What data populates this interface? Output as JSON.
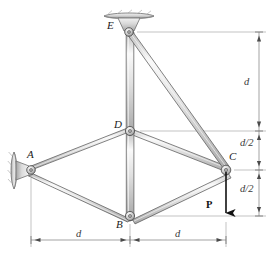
{
  "figure": {
    "type": "structural-truss-diagram"
  },
  "nodes": [
    {
      "id": "E",
      "label": "E",
      "x": 129,
      "y": 32,
      "label_dx": -11,
      "label_dy": -6,
      "support": "ceiling-bracket"
    },
    {
      "id": "D",
      "label": "D",
      "x": 130,
      "y": 131,
      "label_dx": -13,
      "label_dy": -6,
      "support": "none"
    },
    {
      "id": "A",
      "label": "A",
      "x": 31,
      "y": 170,
      "label_dx": -2,
      "label_dy": -17,
      "support": "wall-bracket"
    },
    {
      "id": "C",
      "label": "C",
      "x": 226,
      "y": 170,
      "label_dx": 4,
      "label_dy": -15,
      "support": "none"
    },
    {
      "id": "B",
      "label": "B",
      "x": 130,
      "y": 216,
      "label_dx": -12,
      "label_dy": 6,
      "support": "none"
    }
  ],
  "members": [
    {
      "id": "ED",
      "from": "E",
      "to": "D",
      "name": "member-E-D"
    },
    {
      "id": "EC",
      "from": "E",
      "to": "C",
      "name": "member-E-C"
    },
    {
      "id": "DA",
      "from": "D",
      "to": "A",
      "name": "member-D-A"
    },
    {
      "id": "DC",
      "from": "D",
      "to": "C",
      "name": "member-D-C"
    },
    {
      "id": "DB",
      "from": "D",
      "to": "B",
      "name": "member-D-B"
    },
    {
      "id": "AB",
      "from": "A",
      "to": "B",
      "name": "member-A-B"
    },
    {
      "id": "BC",
      "from": "B",
      "to": "C",
      "name": "member-B-C"
    }
  ],
  "load": {
    "label": "P",
    "label_x": 206,
    "label_y": 206,
    "direction": "down",
    "applied_at": "C",
    "arrow_from_y": 172,
    "arrow_to_y": 216,
    "arrow_x": 226
  },
  "dimensions": {
    "vertical": [
      {
        "id": "d-top",
        "label": "d",
        "label_x": 254,
        "label_y": 85,
        "from_y": 32,
        "to_y": 131
      },
      {
        "id": "d-half-up",
        "label": "d/2",
        "label_x": 251,
        "label_y": 145,
        "from_y": 131,
        "to_y": 170
      },
      {
        "id": "d-half-dn",
        "label": "d/2",
        "label_x": 251,
        "label_y": 191,
        "from_y": 170,
        "to_y": 216
      }
    ],
    "horizontal": [
      {
        "id": "d-left",
        "label": "d",
        "label_x": 76,
        "label_y": 234,
        "from_x": 31,
        "to_x": 130
      },
      {
        "id": "d-right",
        "label": "d",
        "label_x": 175,
        "label_y": 234,
        "from_x": 130,
        "to_x": 226
      }
    ]
  },
  "colors": {
    "member_fill": "#e3e3e3",
    "member_edge": "#4a4a4a",
    "member_highlight": "#f7f7f7",
    "joint_ring": "#555555",
    "joint_fill": "#d2d2d2",
    "support_fill": "#cccccc",
    "support_edge": "#6b6b6b",
    "dimension_line": "#8d8d8d",
    "force_arrow": "#111111",
    "text": "#1b1b1b"
  }
}
